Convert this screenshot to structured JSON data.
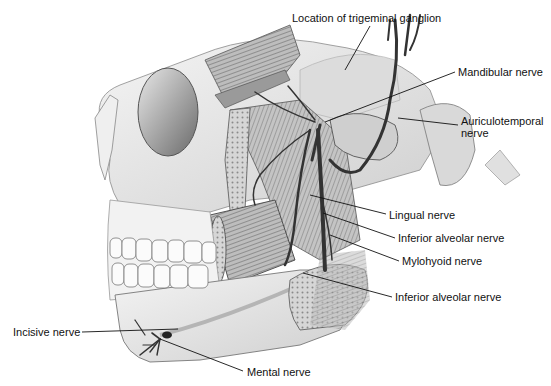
{
  "figure": {
    "style": "grayscale pencil illustration",
    "colors": {
      "background": "#ffffff",
      "ink": "#111111",
      "bone": "#e6e6e6",
      "shade": "#9a9a9a",
      "nerve": "#3a3a3a"
    }
  },
  "labels": [
    {
      "id": "trigeminal-ganglion",
      "text": "Location of trigeminal ganglion",
      "x": 292,
      "y": 12
    },
    {
      "id": "mandibular-nerve",
      "text": "Mandibular nerve",
      "x": 458,
      "y": 66
    },
    {
      "id": "auriculotemporal-nerve-1",
      "text": "Auriculotemporal",
      "x": 461,
      "y": 115
    },
    {
      "id": "auriculotemporal-nerve-2",
      "text": "nerve",
      "x": 461,
      "y": 127
    },
    {
      "id": "lingual-nerve",
      "text": "Lingual nerve",
      "x": 389,
      "y": 209
    },
    {
      "id": "inferior-alveolar-nerve-upper",
      "text": "Inferior alveolar nerve",
      "x": 398,
      "y": 232
    },
    {
      "id": "mylohyoid-nerve",
      "text": "Mylohyoid nerve",
      "x": 402,
      "y": 255
    },
    {
      "id": "inferior-alveolar-nerve-lower",
      "text": "Inferior alveolar nerve",
      "x": 395,
      "y": 291
    },
    {
      "id": "incisive-nerve",
      "text": "Incisive nerve",
      "x": 13,
      "y": 326
    },
    {
      "id": "mental-nerve",
      "text": "Mental nerve",
      "x": 247,
      "y": 366
    }
  ],
  "leaders": [
    {
      "id": "trigeminal-ganglion",
      "x1": 370,
      "y1": 26,
      "x2": 345,
      "y2": 70
    },
    {
      "id": "mandibular-nerve",
      "x1": 455,
      "y1": 72,
      "x2": 325,
      "y2": 122
    },
    {
      "id": "auriculotemporal-nerve",
      "x1": 458,
      "y1": 125,
      "x2": 398,
      "y2": 118
    },
    {
      "id": "lingual-nerve",
      "x1": 386,
      "y1": 214,
      "x2": 310,
      "y2": 195
    },
    {
      "id": "inferior-alveolar-nerve-upper",
      "x1": 395,
      "y1": 238,
      "x2": 323,
      "y2": 213
    },
    {
      "id": "mylohyoid-nerve",
      "x1": 399,
      "y1": 261,
      "x2": 330,
      "y2": 235
    },
    {
      "id": "inferior-alveolar-nerve-lower",
      "x1": 392,
      "y1": 297,
      "x2": 303,
      "y2": 273
    },
    {
      "id": "incisive-nerve",
      "x1": 82,
      "y1": 332,
      "x2": 178,
      "y2": 329
    },
    {
      "id": "mental-nerve",
      "x1": 243,
      "y1": 371,
      "x2": 160,
      "y2": 339
    }
  ]
}
